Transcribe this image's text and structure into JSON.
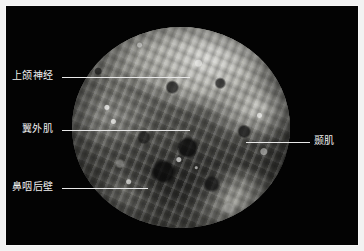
{
  "figure": {
    "type": "annotated-anatomical-photograph",
    "view": "endoscopic circular field",
    "background_color": "#030303",
    "frame_color": "#f2f2f2",
    "label_color": "#f0f0f0",
    "leader_line_color": "#e8e8e8"
  },
  "annotations": [
    {
      "id": "maxillary-nerve",
      "label": "上颌神经",
      "side": "left",
      "label_x": 12,
      "label_y": 70,
      "line_x": 62,
      "line_y": 77,
      "line_length": 128
    },
    {
      "id": "lateral-pterygoid-muscle",
      "label": "翼外肌",
      "side": "left",
      "label_x": 22,
      "label_y": 123,
      "line_x": 62,
      "line_y": 130,
      "line_length": 128
    },
    {
      "id": "posterior-nasopharyngeal-wall",
      "label": "鼻咽后壁",
      "side": "left",
      "label_x": 12,
      "label_y": 181,
      "line_x": 62,
      "line_y": 188,
      "line_length": 86
    },
    {
      "id": "temporalis-muscle",
      "label": "颞肌",
      "side": "right",
      "label_x": 314,
      "label_y": 135,
      "line_x": 246,
      "line_y": 142,
      "line_length": 64
    }
  ]
}
